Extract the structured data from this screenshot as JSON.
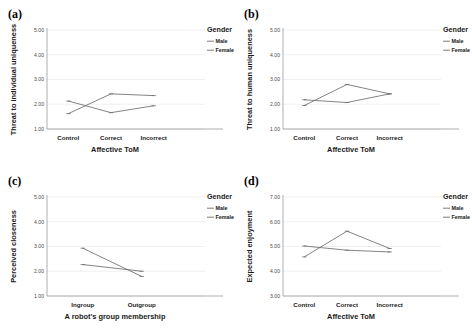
{
  "figure": {
    "legend_title": "Gender",
    "series_names": [
      "Male",
      "Female"
    ],
    "colors": {
      "male": "#6e6e6e",
      "female": "#6e6e6e",
      "grid": "#e6e6e6",
      "axis": "#8c8c8c"
    }
  },
  "chart_data": [
    {
      "type": "line",
      "panel": "(a)",
      "title": "",
      "xlabel": "Affective ToM",
      "ylabel": "Threat to individual uniqueness",
      "categories": [
        "Control",
        "Correct",
        "Incorrect"
      ],
      "ylim": [
        1.0,
        5.0
      ],
      "yticks": [
        "1.00",
        "2.00",
        "3.00",
        "4.00",
        "5.00"
      ],
      "ytick_values": [
        1.0,
        2.0,
        3.0,
        4.0,
        5.0
      ],
      "grid": true,
      "legend_position": "right",
      "series": [
        {
          "name": "Male",
          "values": [
            2.13,
            1.66,
            1.94
          ]
        },
        {
          "name": "Female",
          "values": [
            1.62,
            2.42,
            2.35
          ]
        }
      ]
    },
    {
      "type": "line",
      "panel": "(b)",
      "title": "",
      "xlabel": "Affective ToM",
      "ylabel": "Threat to human uniqueness",
      "categories": [
        "Control",
        "Correct",
        "Incorrect"
      ],
      "ylim": [
        1.0,
        5.0
      ],
      "yticks": [
        "1.00",
        "2.00",
        "3.00",
        "4.00",
        "5.00"
      ],
      "ytick_values": [
        1.0,
        2.0,
        3.0,
        4.0,
        5.0
      ],
      "grid": true,
      "legend_position": "right",
      "series": [
        {
          "name": "Male",
          "values": [
            2.18,
            2.07,
            2.42
          ]
        },
        {
          "name": "Female",
          "values": [
            1.95,
            2.8,
            2.42
          ]
        }
      ]
    },
    {
      "type": "line",
      "panel": "(c)",
      "title": "",
      "xlabel": "A robot's group membership",
      "ylabel": "Perceived closeness",
      "categories": [
        "Ingroup",
        "Outgroup"
      ],
      "ylim": [
        1.0,
        5.0
      ],
      "yticks": [
        "1.00",
        "2.00",
        "3.00",
        "4.00",
        "5.00"
      ],
      "ytick_values": [
        1.0,
        2.0,
        3.0,
        4.0,
        5.0
      ],
      "grid": true,
      "legend_position": "right",
      "series": [
        {
          "name": "Male",
          "values": [
            2.27,
            2.0
          ]
        },
        {
          "name": "Female",
          "values": [
            2.93,
            1.79
          ]
        }
      ]
    },
    {
      "type": "line",
      "panel": "(d)",
      "title": "",
      "xlabel": "Affective ToM",
      "ylabel": "Expected enjoyment",
      "categories": [
        "Control",
        "Correct",
        "Incorrect"
      ],
      "ylim": [
        3.0,
        7.0
      ],
      "yticks": [
        "3.00",
        "4.00",
        "5.00",
        "6.00",
        "7.00"
      ],
      "ytick_values": [
        3.0,
        4.0,
        5.0,
        6.0,
        7.0
      ],
      "grid": true,
      "legend_position": "right",
      "series": [
        {
          "name": "Male",
          "values": [
            5.02,
            4.85,
            4.78
          ]
        },
        {
          "name": "Female",
          "values": [
            4.58,
            5.62,
            4.92
          ]
        }
      ]
    }
  ]
}
